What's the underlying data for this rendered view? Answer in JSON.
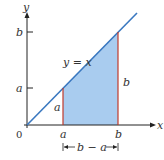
{
  "diagram": {
    "colors": {
      "axis": "#222222",
      "line": "#3a78c0",
      "fill": "#a9ccef",
      "vertical": "#c0392b",
      "text": "#333333"
    },
    "axes": {
      "x_label": "x",
      "y_label": "y",
      "origin_label": "0"
    },
    "line_label": "y = x",
    "x_ticks": [
      "a",
      "b"
    ],
    "y_ticks": [
      "a",
      "b"
    ],
    "height_labels": {
      "left": "a",
      "right": "b"
    },
    "width_annotation": "b − a"
  }
}
